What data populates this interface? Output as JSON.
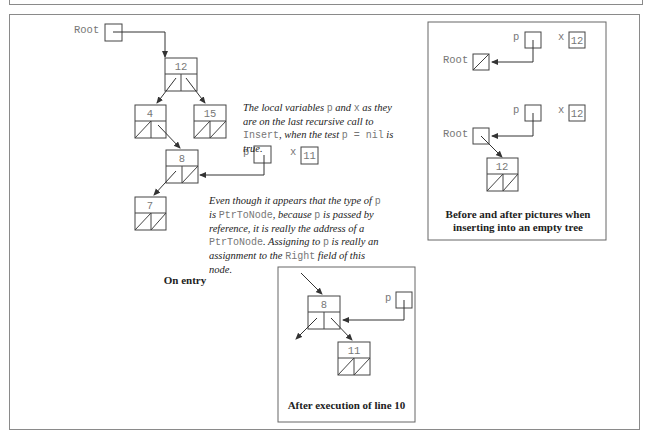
{
  "labels": {
    "root": "Root",
    "p": "p",
    "x": "x"
  },
  "main_tree": {
    "nodes": [
      {
        "id": "n12",
        "value": "12"
      },
      {
        "id": "n4",
        "value": "4"
      },
      {
        "id": "n15",
        "value": "15"
      },
      {
        "id": "n8",
        "value": "8"
      },
      {
        "id": "n7",
        "value": "7"
      }
    ],
    "x_value": "11",
    "caption": "On entry"
  },
  "notes": {
    "locals": {
      "t1": "The local variables ",
      "c1": "p",
      "t2": " and ",
      "c2": "x",
      "t3": " as they are on the last recursive call to ",
      "c3": "Insert",
      "t4": ", when the test ",
      "c4": "p = nil",
      "t5": " is true."
    },
    "reference": {
      "t1": "Even though it appears that the type of ",
      "c1": "p",
      "t2": " is ",
      "c2": "PtrToNode",
      "t3": ", because ",
      "c3": "p",
      "t4": " is passed by reference, it is really the address of a ",
      "c4": "PtrToNode",
      "t5": ".  Assigning to ",
      "c5": "p",
      "t6": " is really an assignment to the ",
      "c6": "Right",
      "t7": " field of this node."
    }
  },
  "empty_tree_panel": {
    "before_x_value": "12",
    "after_x_value": "12",
    "after_node_value": "12",
    "caption_line1": "Before and after pictures when",
    "caption_line2": "inserting into an empty tree"
  },
  "after_line10_panel": {
    "parent_value": "8",
    "new_node_value": "11",
    "caption": "After execution of line 10"
  },
  "colors": {
    "line": "#333333",
    "box": "#444444",
    "mono_text": "#777777",
    "frame": "#8a8a8a"
  }
}
